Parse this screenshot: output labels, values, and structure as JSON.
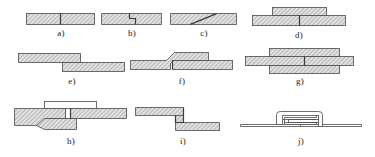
{
  "figure": {
    "background_color": "#ffffff",
    "line_color": "#4a4a4a",
    "hatch_color": "#8a8a8a",
    "label_color": "#1a1a1a"
  },
  "rows": [
    {
      "index": 0,
      "items": [
        "a",
        "b",
        "c",
        "d"
      ]
    },
    {
      "index": 1,
      "items": [
        "e",
        "f",
        "g"
      ]
    },
    {
      "index": 2,
      "items": [
        "h",
        "i",
        "j"
      ]
    }
  ],
  "diagrams": {
    "a": {
      "label": "a)",
      "name": "square-butt-joint",
      "description": "Two plates meeting edge to edge with a straight vertical seam."
    },
    "b": {
      "label": "b)",
      "name": "stepped-butt-joint",
      "description": "Two plates meeting with a Z-shaped stepped seam, rebated halfway through the thickness."
    },
    "c": {
      "label": "c)",
      "name": "scarf-joint",
      "description": "Two plates meeting along a long diagonal scarf seam across the thickness."
    },
    "d": {
      "label": "d)",
      "name": "single-strap-butt-joint",
      "description": "Butt joint with a single cover strap plate laid over the seam on the top face."
    },
    "e": {
      "label": "e)",
      "name": "lap-joint",
      "description": "Two offset plates overlapping, the upper plate resting on the lower plate."
    },
    "f": {
      "label": "f)",
      "name": "joggled-lap-joint",
      "description": "Lap joint where the left plate is joggled with an offset bend so both faces stay flush."
    },
    "g": {
      "label": "g)",
      "name": "double-strap-butt-joint",
      "description": "Butt joint with cover strap plates on both the upper and lower faces."
    },
    "h": {
      "label": "h)",
      "name": "recessed-strap-joint",
      "description": "Butt joint with an unhatched gap block, a plain cover strap above and a tapered reinforcing plate below."
    },
    "i": {
      "label": "i)",
      "name": "hooked-lap-joint",
      "description": "Two plates interlocked by matching right-angle hooked bends at the joint."
    },
    "j": {
      "label": "j)",
      "name": "folded-lock-seam",
      "description": "Sheet-metal lock seam formed by two interlocking folded-back hooks flattened together."
    }
  }
}
